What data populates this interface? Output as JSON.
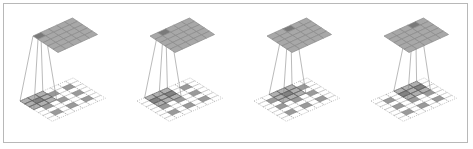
{
  "figure": {
    "colors": {
      "frame_border": "#b8b8b8",
      "output_cell": "#a8a8a8",
      "output_cell_highlight": "#7a7a7a",
      "output_grid_line": "#8a8a8a",
      "input_cell": "#9a9a9a",
      "input_dashed_line": "#9a9a9a",
      "kernel_overlay": "#707070",
      "projection_line": "#8c8c8c"
    },
    "output_grid_size": 5,
    "input_grid_size": 7,
    "kernel_size": 3,
    "input_filled_cells": [
      [
        1,
        1
      ],
      [
        1,
        3
      ],
      [
        1,
        5
      ],
      [
        3,
        1
      ],
      [
        3,
        3
      ],
      [
        3,
        5
      ],
      [
        5,
        1
      ],
      [
        5,
        3
      ],
      [
        5,
        5
      ]
    ],
    "panels": [
      {
        "origin_x": 0,
        "output_highlight": [
          0,
          0
        ],
        "kernel_pos": [
          0,
          0
        ]
      },
      {
        "origin_x": 117,
        "output_highlight": [
          0,
          1
        ],
        "kernel_pos": [
          0,
          1
        ]
      },
      {
        "origin_x": 234,
        "output_highlight": [
          0,
          2
        ],
        "kernel_pos": [
          0,
          2
        ]
      },
      {
        "origin_x": 351,
        "output_highlight": [
          0,
          3
        ],
        "kernel_pos": [
          0,
          3
        ]
      }
    ]
  }
}
